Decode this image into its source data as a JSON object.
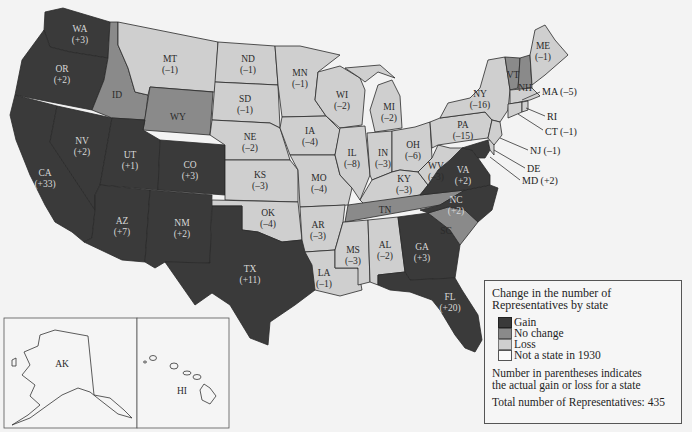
{
  "colors": {
    "gain": "#3a3a3a",
    "no_change": "#8a8a8a",
    "loss": "#cfcfcf",
    "not_state": "#f7f7f7",
    "background": "#f3f3f3"
  },
  "states": {
    "WA": {
      "abbr": "WA",
      "change": "(+3)",
      "status": "gain"
    },
    "OR": {
      "abbr": "OR",
      "change": "(+2)",
      "status": "gain"
    },
    "CA": {
      "abbr": "CA",
      "change": "(+33)",
      "status": "gain"
    },
    "NV": {
      "abbr": "NV",
      "change": "(+2)",
      "status": "gain"
    },
    "ID": {
      "abbr": "ID",
      "change": "",
      "status": "no_change"
    },
    "MT": {
      "abbr": "MT",
      "change": "(–1)",
      "status": "loss"
    },
    "WY": {
      "abbr": "WY",
      "change": "",
      "status": "no_change"
    },
    "UT": {
      "abbr": "UT",
      "change": "(+1)",
      "status": "gain"
    },
    "CO": {
      "abbr": "CO",
      "change": "(+3)",
      "status": "gain"
    },
    "AZ": {
      "abbr": "AZ",
      "change": "(+7)",
      "status": "gain"
    },
    "NM": {
      "abbr": "NM",
      "change": "(+2)",
      "status": "gain"
    },
    "ND": {
      "abbr": "ND",
      "change": "(–1)",
      "status": "loss"
    },
    "SD": {
      "abbr": "SD",
      "change": "(–1)",
      "status": "loss"
    },
    "NE": {
      "abbr": "NE",
      "change": "(–2)",
      "status": "loss"
    },
    "KS": {
      "abbr": "KS",
      "change": "(–3)",
      "status": "loss"
    },
    "OK": {
      "abbr": "OK",
      "change": "(–4)",
      "status": "loss"
    },
    "TX": {
      "abbr": "TX",
      "change": "(+11)",
      "status": "gain"
    },
    "MN": {
      "abbr": "MN",
      "change": "(–1)",
      "status": "loss"
    },
    "IA": {
      "abbr": "IA",
      "change": "(–4)",
      "status": "loss"
    },
    "MO": {
      "abbr": "MO",
      "change": "(–4)",
      "status": "loss"
    },
    "AR": {
      "abbr": "AR",
      "change": "(–3)",
      "status": "loss"
    },
    "LA": {
      "abbr": "LA",
      "change": "(–1)",
      "status": "loss"
    },
    "WI": {
      "abbr": "WI",
      "change": "(–2)",
      "status": "loss"
    },
    "IL": {
      "abbr": "IL",
      "change": "(–8)",
      "status": "loss"
    },
    "MI": {
      "abbr": "MI",
      "change": "(–2)",
      "status": "loss"
    },
    "IN": {
      "abbr": "IN",
      "change": "(–3)",
      "status": "loss"
    },
    "OH": {
      "abbr": "OH",
      "change": "(–6)",
      "status": "loss"
    },
    "KY": {
      "abbr": "KY",
      "change": "(–3)",
      "status": "loss"
    },
    "TN": {
      "abbr": "TN",
      "change": "",
      "status": "no_change"
    },
    "MS": {
      "abbr": "MS",
      "change": "(–3)",
      "status": "loss"
    },
    "AL": {
      "abbr": "AL",
      "change": "(–2)",
      "status": "loss"
    },
    "GA": {
      "abbr": "GA",
      "change": "(+3)",
      "status": "gain"
    },
    "FL": {
      "abbr": "FL",
      "change": "(+20)",
      "status": "gain"
    },
    "SC": {
      "abbr": "SC",
      "change": "",
      "status": "no_change"
    },
    "NC": {
      "abbr": "NC",
      "change": "(+2)",
      "status": "gain"
    },
    "VA": {
      "abbr": "VA",
      "change": "(+2)",
      "status": "gain"
    },
    "WV": {
      "abbr": "WV",
      "change": "(–3)",
      "status": "loss"
    },
    "PA": {
      "abbr": "PA",
      "change": "(–15)",
      "status": "loss"
    },
    "NY": {
      "abbr": "NY",
      "change": "(–16)",
      "status": "loss"
    },
    "VT": {
      "abbr": "VT",
      "change": "",
      "status": "no_change"
    },
    "NH": {
      "abbr": "NH",
      "change": "",
      "status": "no_change"
    },
    "ME": {
      "abbr": "ME",
      "change": "(–1)",
      "status": "loss"
    },
    "AK": {
      "abbr": "AK",
      "change": "",
      "status": "not_state"
    },
    "HI": {
      "abbr": "HI",
      "change": "",
      "status": "not_state"
    }
  },
  "callouts": {
    "MA": "MA (–5)",
    "RI": "RI",
    "CT": "CT (–1)",
    "NJ": "NJ (–1)",
    "DE": "DE",
    "MD": "MD (+2)"
  },
  "legend": {
    "title_line1": "Change in the number of",
    "title_line2": "Representatives by state",
    "items": [
      {
        "label": "Gain",
        "key": "gain"
      },
      {
        "label": "No change",
        "key": "no_change"
      },
      {
        "label": "Loss",
        "key": "loss"
      },
      {
        "label": "Not a state in 1930",
        "key": "not_state"
      }
    ],
    "note_line1": "Number in parentheses indicates",
    "note_line2": "the actual gain or loss for a state",
    "total": "Total number of Representatives: 435"
  }
}
